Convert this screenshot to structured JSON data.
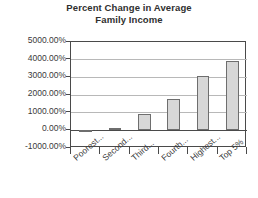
{
  "chart_data": {
    "type": "bar",
    "title": "Percent Change in Average Family Income",
    "title_line1": "Percent Change in Average",
    "title_line2": "Family Income",
    "xlabel": "",
    "ylabel": "",
    "categories": [
      "Poorest...",
      "Second...",
      "Third...",
      "Fourth...",
      "Highest...",
      "Top 5%"
    ],
    "values": [
      -90,
      160,
      930,
      1800,
      3100,
      3900
    ],
    "value_labels": [
      "-90.00%",
      "160.00%",
      "930.00%",
      "1800.00%",
      "3100.00%",
      "3900.00%"
    ],
    "ylim": [
      -1000,
      5000
    ],
    "ytick_values": [
      5000,
      4000,
      3000,
      2000,
      1000,
      0,
      -1000
    ],
    "ytick_labels": [
      "5000.00%",
      "4000.00%",
      "3000.00%",
      "2000.00%",
      "1000.00%",
      "0.00%",
      "-1000.00%"
    ],
    "grid": true,
    "legend": "none",
    "bar_fill_color": "#d7d7d7",
    "bar_border_color": "#6e6e6e",
    "axis_color": "#4a4a4a",
    "gridline_color": "#b8b8b8",
    "background_color": "#ffffff"
  }
}
